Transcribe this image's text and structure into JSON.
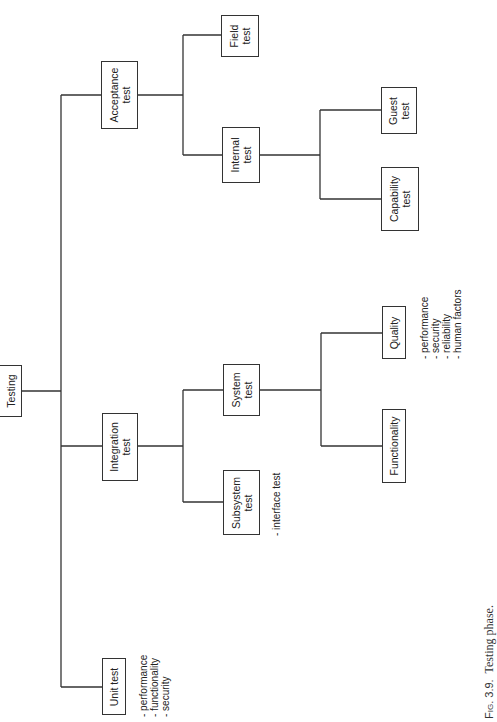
{
  "diagram": {
    "orientation": "rotated -90deg (tree grows left to right on page)",
    "line_color": "#333333",
    "nodes": {
      "root": {
        "lines": [
          "Testing"
        ]
      },
      "unit": {
        "lines": [
          "Unit test"
        ],
        "notes": [
          "- performance",
          "- functionality",
          "- security"
        ]
      },
      "integration": {
        "lines": [
          "Integration",
          "test"
        ]
      },
      "subsystem": {
        "lines": [
          "Subsystem",
          "test"
        ],
        "notes": [
          "- interface test"
        ]
      },
      "system": {
        "lines": [
          "System",
          "test"
        ]
      },
      "functionality": {
        "lines": [
          "Functionality"
        ]
      },
      "quality": {
        "lines": [
          "Quality"
        ],
        "notes": [
          "- performance",
          "- security",
          "- reliability",
          "- human factors"
        ]
      },
      "acceptance": {
        "lines": [
          "Acceptance",
          "test"
        ]
      },
      "field": {
        "lines": [
          "Field",
          "test"
        ]
      },
      "internal": {
        "lines": [
          "Internal",
          "test"
        ]
      },
      "guest": {
        "lines": [
          "Guest",
          "test"
        ]
      },
      "capability": {
        "lines": [
          "Capability",
          "test"
        ]
      }
    },
    "edges": [
      [
        "Testing",
        "Unit test"
      ],
      [
        "Testing",
        "Integration test"
      ],
      [
        "Testing",
        "Acceptance test"
      ],
      [
        "Integration test",
        "Subsystem test"
      ],
      [
        "Integration test",
        "System test"
      ],
      [
        "System test",
        "Functionality"
      ],
      [
        "System test",
        "Quality"
      ],
      [
        "Acceptance test",
        "Field test"
      ],
      [
        "Acceptance test",
        "Internal test"
      ],
      [
        "Internal test",
        "Guest test"
      ],
      [
        "Internal test",
        "Capability test"
      ]
    ]
  },
  "caption": {
    "label": "Fig. 3.9.",
    "text": "Testing phase."
  }
}
